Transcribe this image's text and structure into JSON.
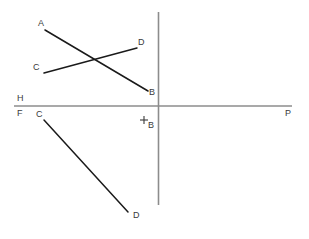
{
  "figure": {
    "canvas": {
      "width": 309,
      "height": 239,
      "background": "#ffffff"
    },
    "colors": {
      "axis": "#8c8c8c",
      "line": "#1a1a1a",
      "label": "#3a3a3a"
    },
    "axes": {
      "ground_line": {
        "name": "horizontal-ground-line",
        "x1": 14,
        "y1": 106,
        "x2": 292,
        "y2": 106,
        "stroke": "#8c8c8c",
        "width": 1.6
      },
      "folding_line": {
        "name": "vertical-folding-line",
        "x1": 158.5,
        "y1": 12,
        "x2": 158.5,
        "y2": 205,
        "stroke": "#8c8c8c",
        "width": 1.6
      }
    },
    "segments": [
      {
        "id": "ab-upper",
        "from": "A",
        "to": "B",
        "x1": 45,
        "y1": 30,
        "x2": 148,
        "y2": 91,
        "stroke": "#1a1a1a",
        "width": 1.5
      },
      {
        "id": "cd-upper",
        "from": "C",
        "to": "D",
        "x1": 44,
        "y1": 73,
        "x2": 137,
        "y2": 48,
        "stroke": "#1a1a1a",
        "width": 1.5
      },
      {
        "id": "cd-lower",
        "from": "C",
        "to": "D",
        "x1": 44,
        "y1": 120,
        "x2": 128,
        "y2": 212,
        "stroke": "#1a1a1a",
        "width": 1.5
      }
    ],
    "crosshair": {
      "name": "point-b-crosshair",
      "cx": 144,
      "cy": 120,
      "arm": 4,
      "stroke": "#3a3a3a",
      "width": 1.1
    },
    "labels": [
      {
        "id": "label-a-upper",
        "text": "A",
        "x": 38,
        "y": 19
      },
      {
        "id": "label-d-upper",
        "text": "D",
        "x": 138,
        "y": 38
      },
      {
        "id": "label-c-upper",
        "text": "C",
        "x": 33,
        "y": 63
      },
      {
        "id": "label-b-upper",
        "text": "B",
        "x": 149,
        "y": 88
      },
      {
        "id": "label-h-axis",
        "text": "H",
        "x": 17,
        "y": 94
      },
      {
        "id": "label-f-axis",
        "text": "F",
        "x": 17,
        "y": 109
      },
      {
        "id": "label-c-lower",
        "text": "C",
        "x": 36,
        "y": 110
      },
      {
        "id": "label-b-origin",
        "text": "B",
        "x": 148,
        "y": 121
      },
      {
        "id": "label-p-axis",
        "text": "P",
        "x": 285,
        "y": 109
      },
      {
        "id": "label-d-lower",
        "text": "D",
        "x": 133,
        "y": 211
      }
    ]
  }
}
